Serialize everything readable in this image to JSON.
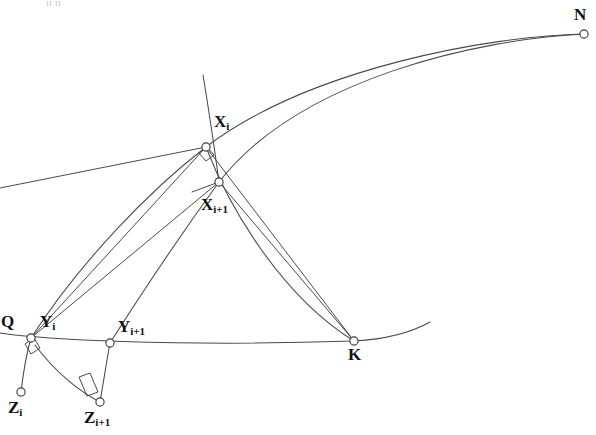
{
  "figure": {
    "title_artifact": "ıı ıı",
    "stroke_color": "#4a4a4a",
    "vertex_fill": "#ffffff",
    "label_color": "#111111",
    "background": "#ffffff",
    "points": [
      {
        "id": "N",
        "base": "N",
        "sub": "",
        "cx": 584,
        "cy": 34,
        "label_x": 574,
        "label_y": 6
      },
      {
        "id": "Xi",
        "base": "X",
        "sub": "i",
        "cx": 206,
        "cy": 147,
        "label_x": 214,
        "label_y": 113
      },
      {
        "id": "Xi1",
        "base": "X",
        "sub": "i+1",
        "cx": 219,
        "cy": 182,
        "label_x": 201,
        "label_y": 196
      },
      {
        "id": "Q",
        "base": "Q",
        "sub": "",
        "cx": 31,
        "cy": 338,
        "label_x": 1,
        "label_y": 313
      },
      {
        "id": "Yi",
        "base": "Y",
        "sub": "i",
        "cx": 31,
        "cy": 338,
        "label_x": 40,
        "label_y": 313
      },
      {
        "id": "Yi1",
        "base": "Y",
        "sub": "i+1",
        "cx": 110,
        "cy": 343,
        "label_x": 118,
        "label_y": 318
      },
      {
        "id": "K",
        "base": "K",
        "sub": "",
        "cx": 354,
        "cy": 341,
        "label_x": 348,
        "label_y": 346
      },
      {
        "id": "Zi",
        "base": "Z",
        "sub": "i",
        "cx": 21,
        "cy": 392,
        "label_x": 8,
        "label_y": 399
      },
      {
        "id": "Zi1",
        "base": "Z",
        "sub": "i+1",
        "cx": 100,
        "cy": 402,
        "label_x": 84,
        "label_y": 409
      }
    ],
    "curves": [
      {
        "name": "arc-Q-Xi-N",
        "d": "M 31 338 C 80 262 150 190 206 147 C 310 68 490 36 584 34"
      },
      {
        "name": "arc-Yi1-Xi1-N",
        "d": "M 110 343 C 150 280 195 215 219 182 C 300 78 480 39 584 34"
      },
      {
        "name": "arc-Q-Yi1-K-E",
        "d": "M 0 333 C 40 339 170 347 354 341 C 390 339 414 331 430 322"
      },
      {
        "name": "arc-Xi-K",
        "d": "M 206 147 C 228 205 280 295 354 341"
      },
      {
        "name": "arc-Yi-Xi1-upper",
        "d": "M 203 75 C 208 105 214 145 219 182"
      },
      {
        "name": "arc-Yi-Zi",
        "d": "M 31 338 C 26 355 23 375 21 392"
      },
      {
        "name": "arc-Yi-Zi1",
        "d": "M 35 345 C 55 372 80 392 100 402"
      },
      {
        "name": "arc-Yi1-Zi1",
        "d": "M 110 343 C 106 365 103 385 100 402"
      }
    ],
    "segments": [
      {
        "name": "seg-Yi-Xi",
        "d": "M 31 338 L 206 147"
      },
      {
        "name": "seg-Yi-Xi1",
        "d": "M 31 338 L 219 182"
      },
      {
        "name": "seg-Xi-K",
        "d": "M 206 147 L 354 341"
      },
      {
        "name": "seg-Xi1-K",
        "d": "M 219 182 L 354 341"
      },
      {
        "name": "seg-Xi-left",
        "d": "M 206 147 L 0 188"
      },
      {
        "name": "seg-Xi1-left",
        "d": "M 219 182 L 192 192"
      }
    ],
    "right_angles": [
      {
        "name": "right-angle-Xi",
        "d": "M 199 153 L 206 161 L 214 155 L 207 147 Z"
      },
      {
        "name": "right-angle-Yi",
        "d": "M 25 344 L 31 354 L 40 348 L 34 338 Z"
      },
      {
        "name": "right-angle-Zi1",
        "d": "M 79 377 L 87 396 L 98 392 L 90 373 Z"
      }
    ]
  }
}
